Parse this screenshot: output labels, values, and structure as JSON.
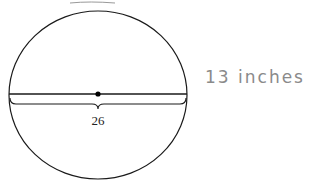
{
  "diagram": {
    "shape": "circle",
    "diameter_label": "26",
    "annotation": "13 inches",
    "colors": {
      "stroke": "#1a1a1a",
      "annotation": "#8a8a8a"
    }
  }
}
